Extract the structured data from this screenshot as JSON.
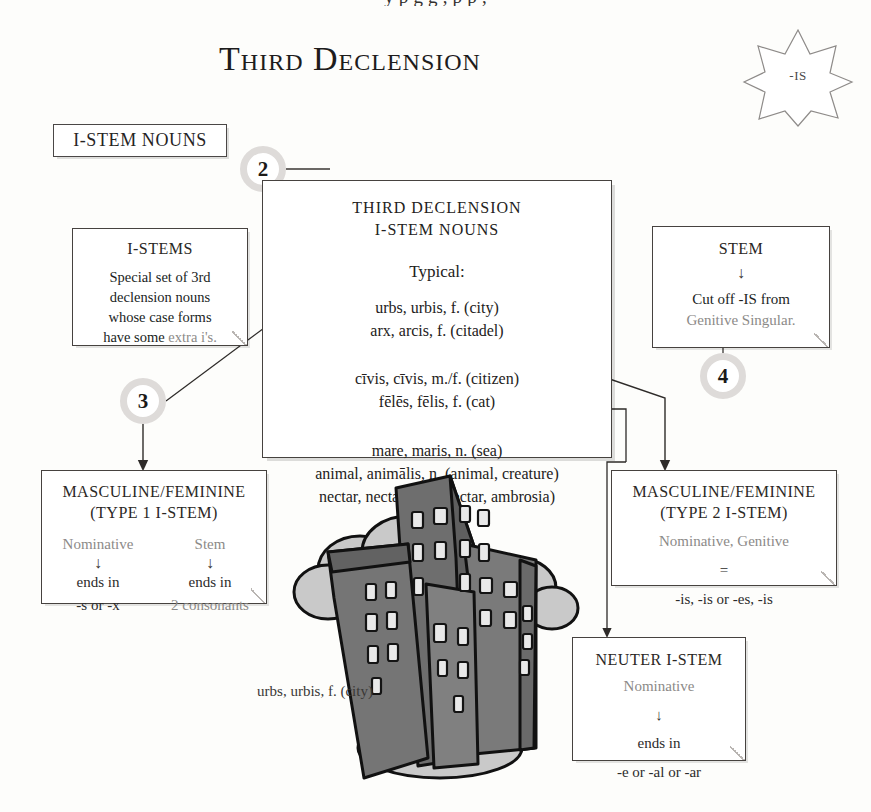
{
  "page": {
    "top_cut_text": "y   p                  g g       , p p ,",
    "title": "Third Declension",
    "starburst_label": "-IS",
    "section_chip": "I-STEM NOUNS",
    "city_caption": "urbs, urbis, f.  (city)"
  },
  "steps": {
    "two": "2",
    "three": "3",
    "four": "4"
  },
  "main_box": {
    "header_line1": "THIRD DECLENSION",
    "header_line2": "I-STEM NOUNS",
    "typical_label": "Typical:",
    "group_feminine": [
      "urbs, urbis, f.  (city)",
      "arx, arcis, f.  (citadel)"
    ],
    "group_common": [
      "cīvis, cīvis, m./f.  (citizen)",
      "fēlēs, fēlis, f.  (cat)"
    ],
    "group_neuter": [
      "mare, maris, n.  (sea)",
      "animal, animālis, n.  (animal, creature)",
      "nectar, nectaris, n.  (nectar, ambrosia)"
    ]
  },
  "istems_box": {
    "title": "I-STEMS",
    "line1": "Special set of 3rd",
    "line2": "declension nouns",
    "line3": "whose case forms",
    "line4_black": "have some ",
    "line4_gray": "extra i's."
  },
  "stem_box": {
    "title": "STEM",
    "arrow": "↓",
    "line1": "Cut off -IS from",
    "line2_gray": "Genitive Singular."
  },
  "type1_box": {
    "title_line1": "MASCULINE/FEMININE",
    "title_line2": "(TYPE 1 I-STEM)",
    "left_head": "Nominative",
    "left_arrow": "↓",
    "left_mid": "ends in",
    "left_tail": "-s or -x",
    "right_head": "Stem",
    "right_arrow": "↓",
    "right_mid": "ends in",
    "right_tail": "2 consonants"
  },
  "type2_box": {
    "title_line1": "MASCULINE/FEMININE",
    "title_line2": "(TYPE 2 I-STEM)",
    "line1": "Nominative, Genitive",
    "equals": "=",
    "line2": "-is, -is  or  -es, -is"
  },
  "neuter_box": {
    "title": "NEUTER I-STEM",
    "line1": "Nominative",
    "arrow": "↓",
    "line2": "ends in",
    "line3": "-e or -al or -ar"
  },
  "colors": {
    "ink": "#2b2b2b",
    "gray_text": "#8c8a88",
    "box_border": "#46423f",
    "step_ring": "#dedbd9",
    "building_dark": "#6e6e6e",
    "building_mid": "#8a8a8a",
    "cloud": "#c9c9c9"
  }
}
